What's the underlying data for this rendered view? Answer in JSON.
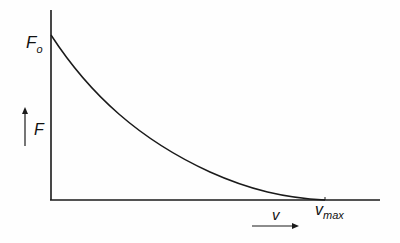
{
  "diagram": {
    "type": "force-velocity curve",
    "y_axis_label": "F",
    "y_intercept_label": "F",
    "y_intercept_subscript": "o",
    "x_axis_label": "v",
    "x_intercept_label": "v",
    "x_intercept_subscript": "max",
    "line_color": "#1a1a1a",
    "curve": {
      "shape": "hyperbolic decay",
      "start": "F_o at v = 0",
      "end": "0 at v = v_max"
    }
  }
}
